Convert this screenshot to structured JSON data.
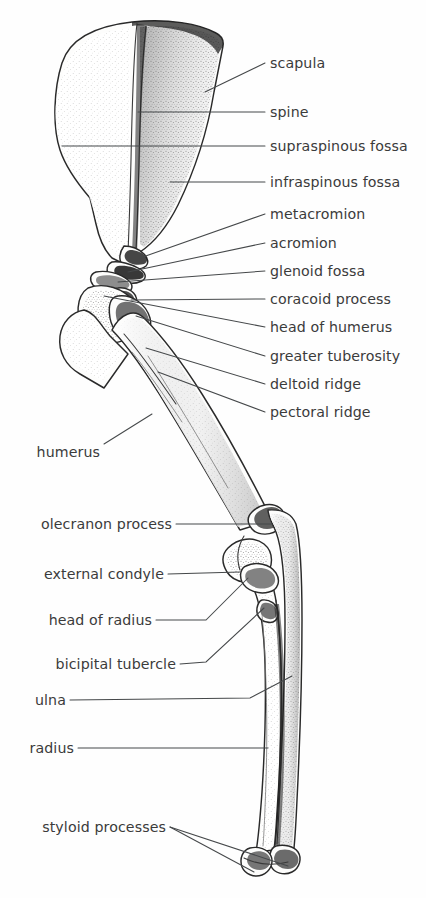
{
  "figure": {
    "background_color": "#fefefe",
    "ink_color": "#2a2a2a",
    "label_color": "#3b3b3b"
  },
  "labels": {
    "scapula": "scapula",
    "spine": "spine",
    "supraspinous_fossa": "supraspinous fossa",
    "infraspinous_fossa": "infraspinous fossa",
    "metacromion": "metacromion",
    "acromion": "acromion",
    "glenoid_fossa": "glenoid fossa",
    "coracoid_process": "coracoid process",
    "head_of_humerus": "head of humerus",
    "greater_tuberosity": "greater tuberosity",
    "deltoid_ridge": "deltoid ridge",
    "pectoral_ridge": "pectoral ridge",
    "humerus": "humerus",
    "olecranon_process": "olecranon process",
    "external_condyle": "external condyle",
    "head_of_radius": "head of radius",
    "bicipital_tubercle": "bicipital tubercle",
    "ulna": "ulna",
    "radius": "radius",
    "styloid_processes": "styloid processes"
  }
}
